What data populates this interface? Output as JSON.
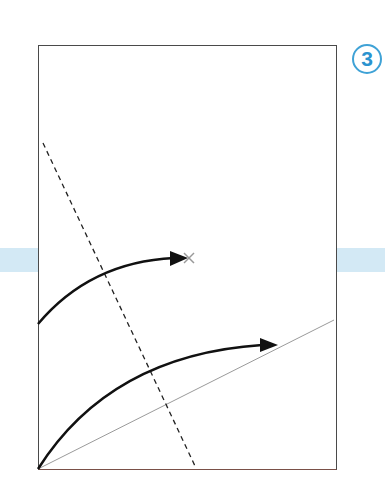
{
  "figure": {
    "step_badge": {
      "label": "3",
      "color": "#3fa2d6"
    },
    "background_band_color": "#d3e9f5",
    "frame": {
      "x": 38,
      "y": 45,
      "width": 298,
      "height": 424,
      "border_color": "#4a4a4a"
    },
    "elements": {
      "dashed_line": {
        "from": [
          43,
          143
        ],
        "to": [
          195,
          466
        ],
        "style": "dashed",
        "color": "#222222"
      },
      "reference_line": {
        "from": [
          38,
          469
        ],
        "to": [
          334,
          320
        ],
        "style": "solid-thin",
        "color": "#9a9a9a"
      },
      "upper_arrow": {
        "start": [
          38,
          324
        ],
        "control": [
          90,
          260
        ],
        "end": [
          186,
          258
        ],
        "color": "#111111",
        "end_marker": "x-mark"
      },
      "lower_arrow": {
        "start": [
          38,
          469
        ],
        "control": [
          120,
          350
        ],
        "end": [
          276,
          345
        ],
        "color": "#111111"
      },
      "x_marker": {
        "position": [
          189,
          258
        ],
        "color": "#999999"
      }
    }
  }
}
